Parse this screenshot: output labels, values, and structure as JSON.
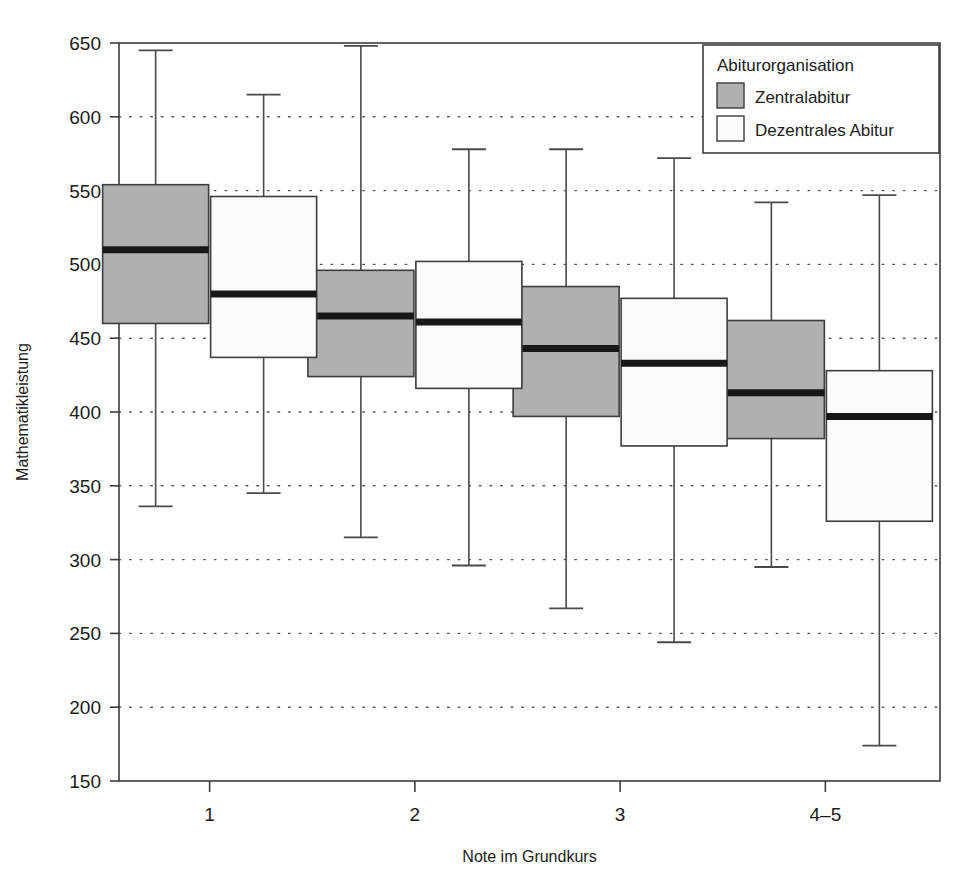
{
  "chart_data": {
    "type": "box",
    "title": "",
    "xlabel": "Note im Grundkurs",
    "ylabel": "Mathematikleistung",
    "categories": [
      "1",
      "2",
      "3",
      "4–5"
    ],
    "ylim": [
      150,
      650
    ],
    "yticks": [
      150,
      200,
      250,
      300,
      350,
      400,
      450,
      500,
      550,
      600,
      650
    ],
    "grid": "horizontal-dotted",
    "legend": {
      "title": "Abiturorganisation",
      "position": "top-right",
      "entries": [
        {
          "label": "Zentralabitur",
          "fill": "#b0b0b0"
        },
        {
          "label": "Dezentrales Abitur",
          "fill": "#fbfbfb"
        }
      ]
    },
    "series": [
      {
        "name": "Zentralabitur",
        "fill": "#b0b0b0",
        "boxes": [
          {
            "category": "1",
            "whisker_low": 336,
            "q1": 460,
            "median": 510,
            "q3": 554,
            "whisker_high": 645
          },
          {
            "category": "2",
            "whisker_low": 315,
            "q1": 424,
            "median": 465,
            "q3": 496,
            "whisker_high": 648
          },
          {
            "category": "3",
            "whisker_low": 267,
            "q1": 397,
            "median": 443,
            "q3": 485,
            "whisker_high": 578
          },
          {
            "category": "4–5",
            "whisker_low": 295,
            "q1": 382,
            "median": 413,
            "q3": 462,
            "whisker_high": 542
          }
        ]
      },
      {
        "name": "Dezentrales Abitur",
        "fill": "#fbfbfb",
        "boxes": [
          {
            "category": "1",
            "whisker_low": 345,
            "q1": 437,
            "median": 480,
            "q3": 546,
            "whisker_high": 615
          },
          {
            "category": "2",
            "whisker_low": 296,
            "q1": 416,
            "median": 461,
            "q3": 502,
            "whisker_high": 578
          },
          {
            "category": "3",
            "whisker_low": 244,
            "q1": 377,
            "median": 433,
            "q3": 477,
            "whisker_high": 572
          },
          {
            "category": "4–5",
            "whisker_low": 174,
            "q1": 326,
            "median": 397,
            "q3": 428,
            "whisker_high": 547
          }
        ]
      }
    ]
  },
  "axes": {
    "y_tick_labels": [
      "650",
      "600",
      "550",
      "500",
      "450",
      "400",
      "350",
      "300",
      "250",
      "200",
      "150"
    ],
    "x_tick_labels": [
      "1",
      "2",
      "3",
      "4–5"
    ],
    "y_title": "Mathematikleistung",
    "x_title": "Note im Grundkurs"
  },
  "legend": {
    "title": "Abiturorganisation",
    "item1": "Zentralabitur",
    "item2": "Dezentrales Abitur"
  },
  "colors": {
    "box_fill_central": "#b0b0b0",
    "box_fill_decentral": "#fbfbfb",
    "outline": "#3d3d3d",
    "median": "#181818",
    "grid": "#555555",
    "axis": "#3d3d3d",
    "background": "#ffffff"
  }
}
